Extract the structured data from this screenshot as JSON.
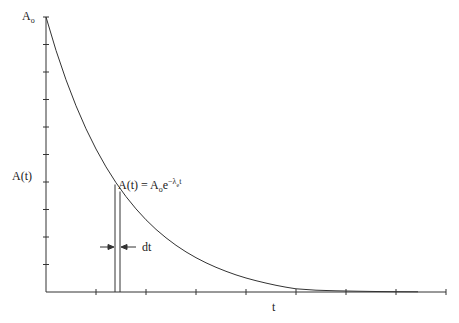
{
  "diagram": {
    "y_axis": {
      "label": "A(t)",
      "top_label_base": "A",
      "top_label_sub": "o",
      "tick_count": 10
    },
    "x_axis": {
      "label": "t",
      "tick_count": 8
    },
    "curve_equation": {
      "lhs": "A(t) = ",
      "base": "A",
      "base_sub": "o",
      "e": "e",
      "exponent": "−λ",
      "exponent_sub": "e",
      "exponent_tail": "t"
    },
    "strip_label": "dt",
    "colors": {
      "line": "#333333",
      "background": "#ffffff"
    }
  }
}
